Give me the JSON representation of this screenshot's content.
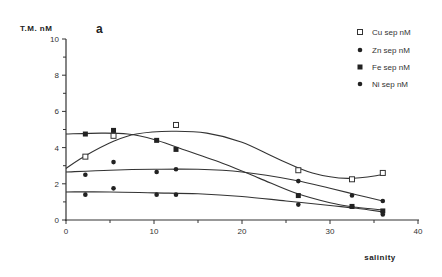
{
  "chart_data": {
    "type": "scatter",
    "panel_label": "a",
    "title": "",
    "ylabel": "T.M.  nM",
    "xlabel": "salinity",
    "xlim": [
      0,
      40
    ],
    "ylim": [
      0,
      10
    ],
    "x_ticks": [
      0,
      10,
      20,
      30,
      40
    ],
    "x_tick_labels": [
      "0",
      "10",
      "20",
      "30",
      "40"
    ],
    "y_ticks": [
      0,
      2,
      4,
      6,
      8,
      10
    ],
    "y_tick_labels": [
      "0",
      "2",
      "4",
      "6",
      "8",
      "10"
    ],
    "grid": false,
    "legend_position": "top-right",
    "series": [
      {
        "name": "Cu sep nM",
        "marker": "open-square",
        "points": [
          [
            2.2,
            3.5
          ],
          [
            5.4,
            4.65
          ],
          [
            12.5,
            5.25
          ],
          [
            26.4,
            2.75
          ],
          [
            32.5,
            2.25
          ],
          [
            36.0,
            2.6
          ]
        ],
        "fit": [
          [
            0,
            2.85
          ],
          [
            2.2,
            3.55
          ],
          [
            5.4,
            4.35
          ],
          [
            8,
            4.75
          ],
          [
            12,
            4.9
          ],
          [
            16,
            4.8
          ],
          [
            20,
            4.3
          ],
          [
            24,
            3.4
          ],
          [
            28,
            2.6
          ],
          [
            32,
            2.3
          ],
          [
            36,
            2.5
          ]
        ]
      },
      {
        "name": "Zn sep nM",
        "marker": "filled-circle",
        "points": [
          [
            2.2,
            2.5
          ],
          [
            5.4,
            3.2
          ],
          [
            10.3,
            2.65
          ],
          [
            12.5,
            2.8
          ],
          [
            26.4,
            2.15
          ],
          [
            32.5,
            1.35
          ],
          [
            36.0,
            1.05
          ]
        ],
        "fit": [
          [
            0,
            2.65
          ],
          [
            5,
            2.75
          ],
          [
            10,
            2.8
          ],
          [
            15,
            2.8
          ],
          [
            20,
            2.65
          ],
          [
            26,
            2.2
          ],
          [
            30,
            1.75
          ],
          [
            33,
            1.4
          ],
          [
            36,
            1.05
          ]
        ]
      },
      {
        "name": "Fe sep nM",
        "marker": "filled-square",
        "points": [
          [
            2.2,
            4.75
          ],
          [
            5.4,
            4.95
          ],
          [
            10.3,
            4.4
          ],
          [
            12.5,
            3.9
          ],
          [
            26.4,
            1.35
          ],
          [
            32.5,
            0.75
          ],
          [
            36.0,
            0.5
          ]
        ],
        "fit": [
          [
            0,
            4.75
          ],
          [
            4,
            4.8
          ],
          [
            7,
            4.75
          ],
          [
            10,
            4.45
          ],
          [
            13,
            3.95
          ],
          [
            18,
            3.1
          ],
          [
            22,
            2.3
          ],
          [
            26,
            1.5
          ],
          [
            30,
            0.95
          ],
          [
            33,
            0.7
          ],
          [
            36,
            0.55
          ]
        ]
      },
      {
        "name": "Ni sep nM",
        "marker": "filled-circle",
        "points": [
          [
            2.2,
            1.4
          ],
          [
            5.4,
            1.75
          ],
          [
            10.3,
            1.4
          ],
          [
            12.5,
            1.4
          ],
          [
            26.4,
            0.85
          ],
          [
            32.5,
            0.75
          ],
          [
            36.0,
            0.3
          ]
        ],
        "fit": [
          [
            0,
            1.55
          ],
          [
            5,
            1.55
          ],
          [
            10,
            1.5
          ],
          [
            15,
            1.45
          ],
          [
            20,
            1.3
          ],
          [
            25,
            1.05
          ],
          [
            30,
            0.8
          ],
          [
            33,
            0.65
          ],
          [
            36,
            0.45
          ]
        ]
      }
    ]
  }
}
